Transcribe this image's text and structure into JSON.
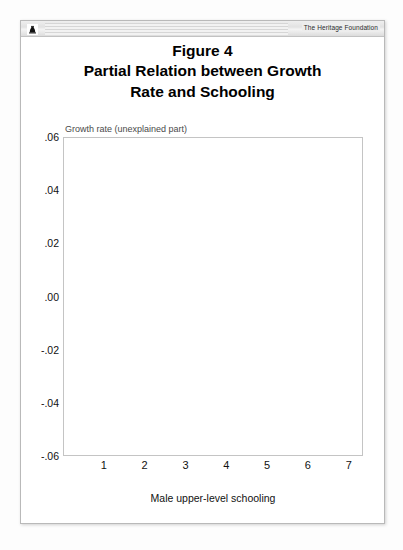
{
  "header": {
    "logo_icon": "liberty-bell-icon",
    "brand": "The Heritage Foundation"
  },
  "title": {
    "line1": "Figure 4",
    "line2": "Partial Relation between Growth",
    "line3": "Rate and Schooling"
  },
  "chart_data": {
    "type": "scatter",
    "xlabel": "Male upper-level schooling",
    "ylabel": "Growth rate (unexplained part)",
    "xlim": [
      0,
      7.35
    ],
    "ylim": [
      -0.06,
      0.06
    ],
    "xticks": [
      1,
      2,
      3,
      4,
      5,
      6,
      7
    ],
    "xticklabels": [
      "1",
      "2",
      "3",
      "4",
      "5",
      "6",
      "7"
    ],
    "yticks": [
      -0.06,
      -0.04,
      -0.02,
      0.0,
      0.02,
      0.04,
      0.06
    ],
    "yticklabels": [
      "-.06",
      "-.04",
      "-.02",
      ".00",
      ".02",
      ".04",
      ".06"
    ],
    "grid": true,
    "grid_style": "dashed",
    "grid_color": "#cfcfcf",
    "marker": "open-circle",
    "marker_color": "#8a8a8a",
    "legend": null,
    "fit_line": {
      "name": "fitted regression line",
      "color": "#8a8a8a",
      "x": [
        0.42,
        6.02
      ],
      "y": [
        0.0022,
        0.0192
      ]
    },
    "points": [
      [
        1.62,
        0.0512
      ],
      [
        2.92,
        0.0432
      ],
      [
        1.18,
        0.0402
      ],
      [
        1.24,
        0.04
      ],
      [
        3.62,
        0.0385
      ],
      [
        2.6,
        0.0402
      ],
      [
        2.98,
        0.0355
      ],
      [
        0.52,
        0.0318
      ],
      [
        0.78,
        0.0322
      ],
      [
        1.1,
        0.03
      ],
      [
        1.32,
        0.0296
      ],
      [
        1.95,
        0.031
      ],
      [
        3.54,
        0.03
      ],
      [
        0.46,
        0.0262
      ],
      [
        0.6,
        0.0258
      ],
      [
        0.88,
        0.0252
      ],
      [
        1.04,
        0.0268
      ],
      [
        1.5,
        0.024
      ],
      [
        2.1,
        0.0265
      ],
      [
        2.22,
        0.0252
      ],
      [
        2.86,
        0.0238
      ],
      [
        3.18,
        0.0232
      ],
      [
        4.02,
        0.0225
      ],
      [
        0.5,
        0.0222
      ],
      [
        0.72,
        0.0215
      ],
      [
        1.42,
        0.0208
      ],
      [
        1.56,
        0.0218
      ],
      [
        1.88,
        0.0202
      ],
      [
        2.48,
        0.0208
      ],
      [
        4.38,
        0.0196
      ],
      [
        6.02,
        0.0192
      ],
      [
        0.44,
        0.0182
      ],
      [
        0.66,
        0.0175
      ],
      [
        0.94,
        0.0188
      ],
      [
        1.26,
        0.017
      ],
      [
        1.7,
        0.0178
      ],
      [
        2.02,
        0.0165
      ],
      [
        2.34,
        0.0172
      ],
      [
        2.7,
        0.016
      ],
      [
        3.06,
        0.0168
      ],
      [
        3.82,
        0.0158
      ],
      [
        0.4,
        0.0148
      ],
      [
        0.58,
        0.0152
      ],
      [
        0.82,
        0.0142
      ],
      [
        1.06,
        0.0155
      ],
      [
        1.36,
        0.0138
      ],
      [
        1.64,
        0.0146
      ],
      [
        1.92,
        0.0132
      ],
      [
        2.26,
        0.014
      ],
      [
        2.58,
        0.0128
      ],
      [
        2.94,
        0.0135
      ],
      [
        3.3,
        0.0122
      ],
      [
        4.62,
        0.0118
      ],
      [
        0.48,
        0.0112
      ],
      [
        0.7,
        0.012
      ],
      [
        0.9,
        0.0105
      ],
      [
        1.14,
        0.0116
      ],
      [
        1.44,
        0.0098
      ],
      [
        1.74,
        0.011
      ],
      [
        2.06,
        0.0095
      ],
      [
        2.38,
        0.0104
      ],
      [
        2.78,
        0.0088
      ],
      [
        3.14,
        0.0096
      ],
      [
        3.46,
        0.0082
      ],
      [
        4.1,
        0.009
      ],
      [
        5.1,
        0.0085
      ],
      [
        0.42,
        0.0072
      ],
      [
        0.62,
        0.008
      ],
      [
        0.86,
        0.0065
      ],
      [
        1.02,
        0.0076
      ],
      [
        1.22,
        0.0058
      ],
      [
        1.48,
        0.007
      ],
      [
        1.68,
        0.0052
      ],
      [
        1.86,
        0.0062
      ],
      [
        2.14,
        0.0045
      ],
      [
        2.42,
        0.0056
      ],
      [
        2.66,
        0.004
      ],
      [
        2.9,
        0.005
      ],
      [
        3.22,
        0.0035
      ],
      [
        3.58,
        0.0044
      ],
      [
        4.26,
        0.0038
      ],
      [
        4.86,
        0.003
      ],
      [
        0.38,
        0.0028
      ],
      [
        0.54,
        0.0036
      ],
      [
        0.74,
        0.002
      ],
      [
        0.96,
        0.0032
      ],
      [
        1.12,
        0.0014
      ],
      [
        1.3,
        0.0026
      ],
      [
        1.52,
        0.0008
      ],
      [
        1.72,
        0.0018
      ],
      [
        1.9,
        0.0002
      ],
      [
        2.08,
        0.0012
      ],
      [
        2.3,
        -0.0004
      ],
      [
        2.54,
        0.0006
      ],
      [
        2.74,
        -0.001
      ],
      [
        3.02,
        0.0
      ],
      [
        3.34,
        -0.0016
      ],
      [
        3.7,
        -0.0006
      ],
      [
        4.18,
        -0.0012
      ],
      [
        4.54,
        -0.0018
      ],
      [
        0.36,
        -0.0022
      ],
      [
        0.5,
        -0.0014
      ],
      [
        0.68,
        -0.0028
      ],
      [
        0.84,
        -0.0018
      ],
      [
        1.0,
        -0.0032
      ],
      [
        1.16,
        -0.0024
      ],
      [
        1.34,
        -0.0038
      ],
      [
        1.54,
        -0.0028
      ],
      [
        1.66,
        -0.0042
      ],
      [
        1.8,
        -0.0032
      ],
      [
        1.98,
        -0.0046
      ],
      [
        2.18,
        -0.0036
      ],
      [
        2.36,
        -0.005
      ],
      [
        2.62,
        -0.004
      ],
      [
        2.82,
        -0.0054
      ],
      [
        3.1,
        -0.0044
      ],
      [
        3.42,
        -0.0058
      ],
      [
        3.9,
        -0.0048
      ],
      [
        4.46,
        -0.0062
      ],
      [
        5.46,
        -0.0056
      ],
      [
        0.4,
        -0.0068
      ],
      [
        0.56,
        -0.006
      ],
      [
        0.76,
        -0.0074
      ],
      [
        0.92,
        -0.0064
      ],
      [
        1.08,
        -0.0078
      ],
      [
        1.2,
        -0.007
      ],
      [
        1.38,
        -0.0084
      ],
      [
        1.46,
        -0.0074
      ],
      [
        1.58,
        -0.0088
      ],
      [
        1.76,
        -0.0078
      ],
      [
        1.94,
        -0.0092
      ],
      [
        2.12,
        -0.0082
      ],
      [
        2.28,
        -0.0096
      ],
      [
        2.46,
        -0.0086
      ],
      [
        2.7,
        -0.01
      ],
      [
        2.98,
        -0.009
      ],
      [
        3.26,
        -0.0104
      ],
      [
        3.66,
        -0.0094
      ],
      [
        4.06,
        -0.0108
      ],
      [
        4.7,
        -0.0098
      ],
      [
        0.34,
        -0.0115
      ],
      [
        0.52,
        -0.0106
      ],
      [
        0.72,
        -0.012
      ],
      [
        0.88,
        -0.011
      ],
      [
        1.04,
        -0.0124
      ],
      [
        1.18,
        -0.0114
      ],
      [
        1.28,
        -0.0128
      ],
      [
        1.42,
        -0.0118
      ],
      [
        1.6,
        -0.0132
      ],
      [
        1.78,
        -0.0122
      ],
      [
        1.96,
        -0.0136
      ],
      [
        2.16,
        -0.0126
      ],
      [
        2.4,
        -0.014
      ],
      [
        2.64,
        -0.013
      ],
      [
        2.88,
        -0.0144
      ],
      [
        3.16,
        -0.0134
      ],
      [
        3.5,
        -0.0148
      ],
      [
        3.98,
        -0.0138
      ],
      [
        4.34,
        -0.0152
      ],
      [
        5.22,
        -0.0142
      ],
      [
        0.38,
        -0.0162
      ],
      [
        0.54,
        -0.0154
      ],
      [
        0.7,
        -0.0168
      ],
      [
        0.86,
        -0.0158
      ],
      [
        0.98,
        -0.0172
      ],
      [
        1.12,
        -0.0162
      ],
      [
        1.24,
        -0.0176
      ],
      [
        1.4,
        -0.0166
      ],
      [
        1.56,
        -0.018
      ],
      [
        1.7,
        -0.017
      ],
      [
        1.88,
        -0.0184
      ],
      [
        2.04,
        -0.0174
      ],
      [
        2.24,
        -0.0188
      ],
      [
        2.5,
        -0.0178
      ],
      [
        2.76,
        -0.0192
      ],
      [
        3.06,
        -0.0182
      ],
      [
        3.38,
        -0.0196
      ],
      [
        3.78,
        -0.0186
      ],
      [
        4.14,
        -0.02
      ],
      [
        4.94,
        -0.019
      ],
      [
        0.32,
        -0.0212
      ],
      [
        0.48,
        -0.0204
      ],
      [
        0.64,
        -0.0218
      ],
      [
        0.8,
        -0.0208
      ],
      [
        0.94,
        -0.0222
      ],
      [
        1.1,
        -0.0212
      ],
      [
        1.22,
        -0.0226
      ],
      [
        1.36,
        -0.0216
      ],
      [
        1.5,
        -0.023
      ],
      [
        1.64,
        -0.022
      ],
      [
        1.82,
        -0.0234
      ],
      [
        2.0,
        -0.0224
      ],
      [
        2.2,
        -0.0238
      ],
      [
        2.44,
        -0.0228
      ],
      [
        2.68,
        -0.0242
      ],
      [
        2.96,
        -0.0232
      ],
      [
        3.28,
        -0.0246
      ],
      [
        3.74,
        -0.0236
      ],
      [
        4.22,
        -0.025
      ],
      [
        5.34,
        -0.024
      ],
      [
        0.36,
        -0.0262
      ],
      [
        0.52,
        -0.0254
      ],
      [
        0.68,
        -0.0268
      ],
      [
        0.84,
        -0.0258
      ],
      [
        1.0,
        -0.0272
      ],
      [
        1.14,
        -0.0262
      ],
      [
        1.3,
        -0.0276
      ],
      [
        1.44,
        -0.0266
      ],
      [
        1.62,
        -0.028
      ],
      [
        1.8,
        -0.027
      ],
      [
        1.98,
        -0.0284
      ],
      [
        2.18,
        -0.0274
      ],
      [
        2.42,
        -0.0288
      ],
      [
        2.72,
        -0.0278
      ],
      [
        3.0,
        -0.0292
      ],
      [
        3.32,
        -0.0282
      ],
      [
        3.86,
        -0.0296
      ],
      [
        4.42,
        -0.0286
      ],
      [
        0.42,
        -0.0308
      ],
      [
        0.58,
        -0.03
      ],
      [
        0.76,
        -0.0314
      ],
      [
        0.9,
        -0.0304
      ],
      [
        1.06,
        -0.0318
      ],
      [
        1.2,
        -0.0308
      ],
      [
        1.34,
        -0.0322
      ],
      [
        1.48,
        -0.0312
      ],
      [
        1.68,
        -0.0326
      ],
      [
        1.86,
        -0.0316
      ],
      [
        2.08,
        -0.033
      ],
      [
        2.32,
        -0.032
      ],
      [
        2.58,
        -0.0334
      ],
      [
        2.84,
        -0.0324
      ],
      [
        3.2,
        -0.0338
      ],
      [
        3.6,
        -0.0328
      ],
      [
        0.46,
        -0.0352
      ],
      [
        0.62,
        -0.0344
      ],
      [
        0.8,
        -0.0358
      ],
      [
        0.96,
        -0.0348
      ],
      [
        1.12,
        -0.0362
      ],
      [
        1.28,
        -0.0352
      ],
      [
        1.46,
        -0.0366
      ],
      [
        1.66,
        -0.0356
      ],
      [
        1.9,
        -0.037
      ],
      [
        2.26,
        -0.036
      ],
      [
        2.62,
        -0.0374
      ],
      [
        3.08,
        -0.0364
      ],
      [
        0.5,
        -0.0398
      ],
      [
        0.68,
        -0.0388
      ],
      [
        0.88,
        -0.0402
      ],
      [
        1.08,
        -0.0392
      ],
      [
        1.32,
        -0.0406
      ],
      [
        1.58,
        -0.0396
      ],
      [
        1.94,
        -0.041
      ],
      [
        2.4,
        -0.04
      ],
      [
        0.74,
        -0.0448
      ],
      [
        0.98,
        -0.0438
      ],
      [
        1.26,
        -0.0452
      ],
      [
        0.6,
        -0.0468
      ]
    ]
  }
}
